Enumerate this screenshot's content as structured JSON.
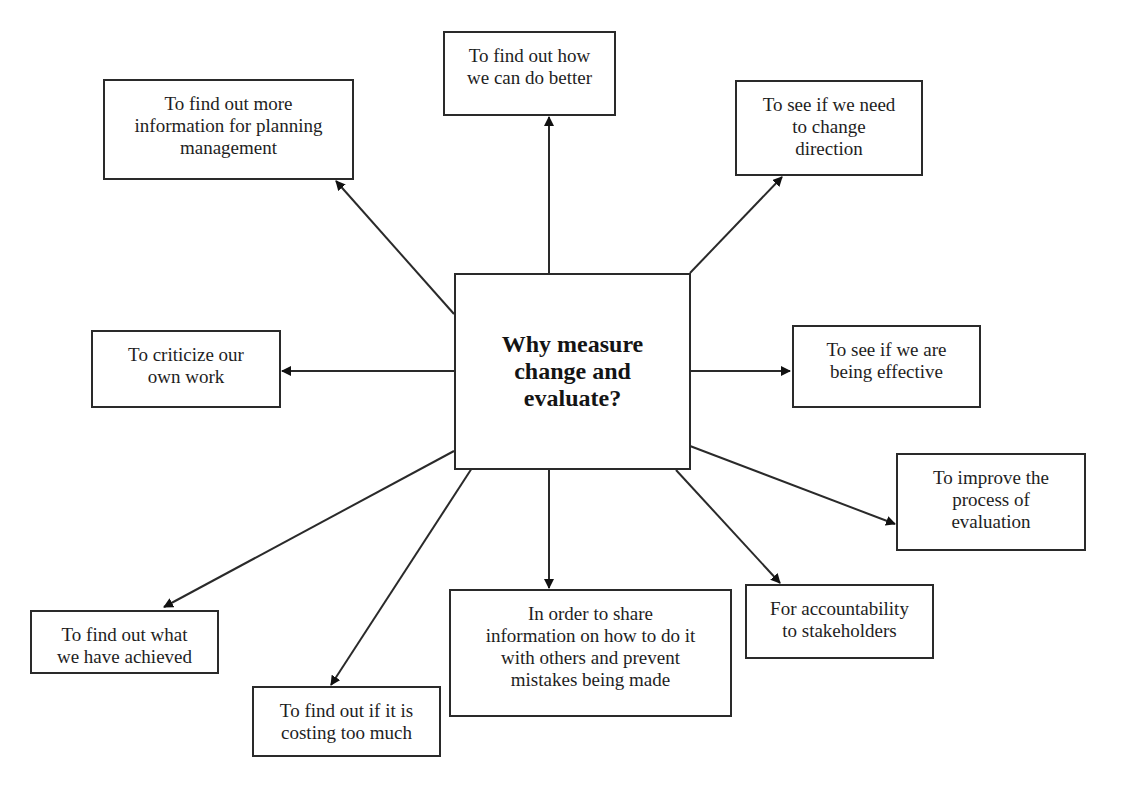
{
  "diagram": {
    "center": "Why measure\nchange and\nevaluate?",
    "nodes": {
      "planning": "To find out more\ninformation for planning\nmanagement",
      "better": "To find out how\nwe can do better",
      "direction": "To see if we need\nto change\ndirection",
      "criticize": "To criticize our\nown work",
      "effective": "To see if we are\nbeing effective",
      "improve": "To improve the\nprocess of\nevaluation",
      "achieved": "To find out what\nwe have achieved",
      "costing": "To find out if it is\ncosting too much",
      "share": "In order to share\ninformation on how to do it\nwith others and prevent\nmistakes being made",
      "accountability": "For accountability\nto stakeholders"
    },
    "edges": [
      {
        "from": "center",
        "to": "planning"
      },
      {
        "from": "center",
        "to": "better"
      },
      {
        "from": "center",
        "to": "direction"
      },
      {
        "from": "center",
        "to": "criticize"
      },
      {
        "from": "center",
        "to": "effective"
      },
      {
        "from": "center",
        "to": "improve"
      },
      {
        "from": "center",
        "to": "achieved"
      },
      {
        "from": "center",
        "to": "costing"
      },
      {
        "from": "center",
        "to": "share"
      },
      {
        "from": "center",
        "to": "accountability"
      }
    ]
  }
}
